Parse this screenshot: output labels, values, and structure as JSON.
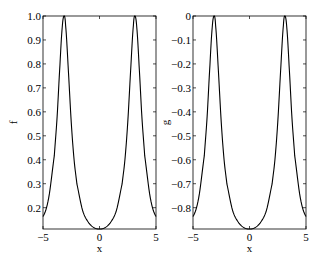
{
  "chart_data": [
    {
      "type": "line",
      "title": "",
      "xlabel": "x",
      "ylabel": "f",
      "xlim": [
        -5,
        5
      ],
      "ylim": [
        0.111,
        1.0
      ],
      "xticks": [
        -5,
        0,
        5
      ],
      "xtick_labels": [
        "−5",
        "0",
        "5"
      ],
      "yticks": [
        0.2,
        0.3,
        0.4,
        0.5,
        0.6,
        0.7,
        0.8,
        0.9,
        1.0
      ],
      "ytick_labels": [
        "0.2",
        "0.3",
        "0.4",
        "0.5",
        "0.6",
        "0.7",
        "0.8",
        "0.9",
        "1.0"
      ],
      "grid": false,
      "legend": null,
      "series": [
        {
          "name": "f",
          "color": "#000000",
          "x": [
            -5,
            -4.5,
            -4,
            -3.75,
            -3.5,
            -3.3,
            -3.1416,
            -3,
            -2.75,
            -2.5,
            -2.25,
            -2,
            -1.5,
            -1,
            -0.5,
            0,
            0.5,
            1,
            1.5,
            2,
            2.25,
            2.5,
            2.75,
            3,
            3.1416,
            3.3,
            3.5,
            3.75,
            4,
            4.5,
            5
          ],
          "values": [
            0.163,
            0.24,
            0.417,
            0.58,
            0.796,
            0.952,
            1.0,
            0.961,
            0.768,
            0.556,
            0.4,
            0.299,
            0.189,
            0.14,
            0.117,
            0.111,
            0.117,
            0.14,
            0.189,
            0.299,
            0.4,
            0.556,
            0.768,
            0.961,
            1.0,
            0.952,
            0.796,
            0.58,
            0.417,
            0.24,
            0.163
          ]
        }
      ]
    },
    {
      "type": "line",
      "title": "",
      "xlabel": "x",
      "ylabel": "g",
      "xlim": [
        -5,
        5
      ],
      "ylim": [
        -0.889,
        0
      ],
      "xticks": [
        -5,
        0,
        5
      ],
      "xtick_labels": [
        "−5",
        "0",
        "5"
      ],
      "yticks": [
        -0.8,
        -0.7,
        -0.6,
        -0.5,
        -0.4,
        -0.3,
        -0.2,
        -0.1,
        0
      ],
      "ytick_labels": [
        "−0.8",
        "−0.7",
        "−0.6",
        "−0.5",
        "−0.4",
        "−0.3",
        "−0.2",
        "−0.1",
        "0"
      ],
      "grid": false,
      "legend": null,
      "series": [
        {
          "name": "g",
          "color": "#000000",
          "x": [
            -5,
            -4.5,
            -4,
            -3.75,
            -3.5,
            -3.3,
            -3.1416,
            -3,
            -2.75,
            -2.5,
            -2.25,
            -2,
            -1.5,
            -1,
            -0.5,
            0,
            0.5,
            1,
            1.5,
            2,
            2.25,
            2.5,
            2.75,
            3,
            3.1416,
            3.3,
            3.5,
            3.75,
            4,
            4.5,
            5
          ],
          "values": [
            -0.837,
            -0.76,
            -0.583,
            -0.42,
            -0.204,
            -0.048,
            0.0,
            -0.039,
            -0.232,
            -0.444,
            -0.6,
            -0.701,
            -0.811,
            -0.86,
            -0.883,
            -0.889,
            -0.883,
            -0.86,
            -0.811,
            -0.701,
            -0.6,
            -0.444,
            -0.232,
            -0.039,
            0.0,
            -0.048,
            -0.204,
            -0.42,
            -0.583,
            -0.76,
            -0.837
          ]
        }
      ]
    }
  ],
  "panels": [
    {
      "ylabel": "f",
      "xlabel": "x"
    },
    {
      "ylabel": "g",
      "xlabel": "x"
    }
  ]
}
